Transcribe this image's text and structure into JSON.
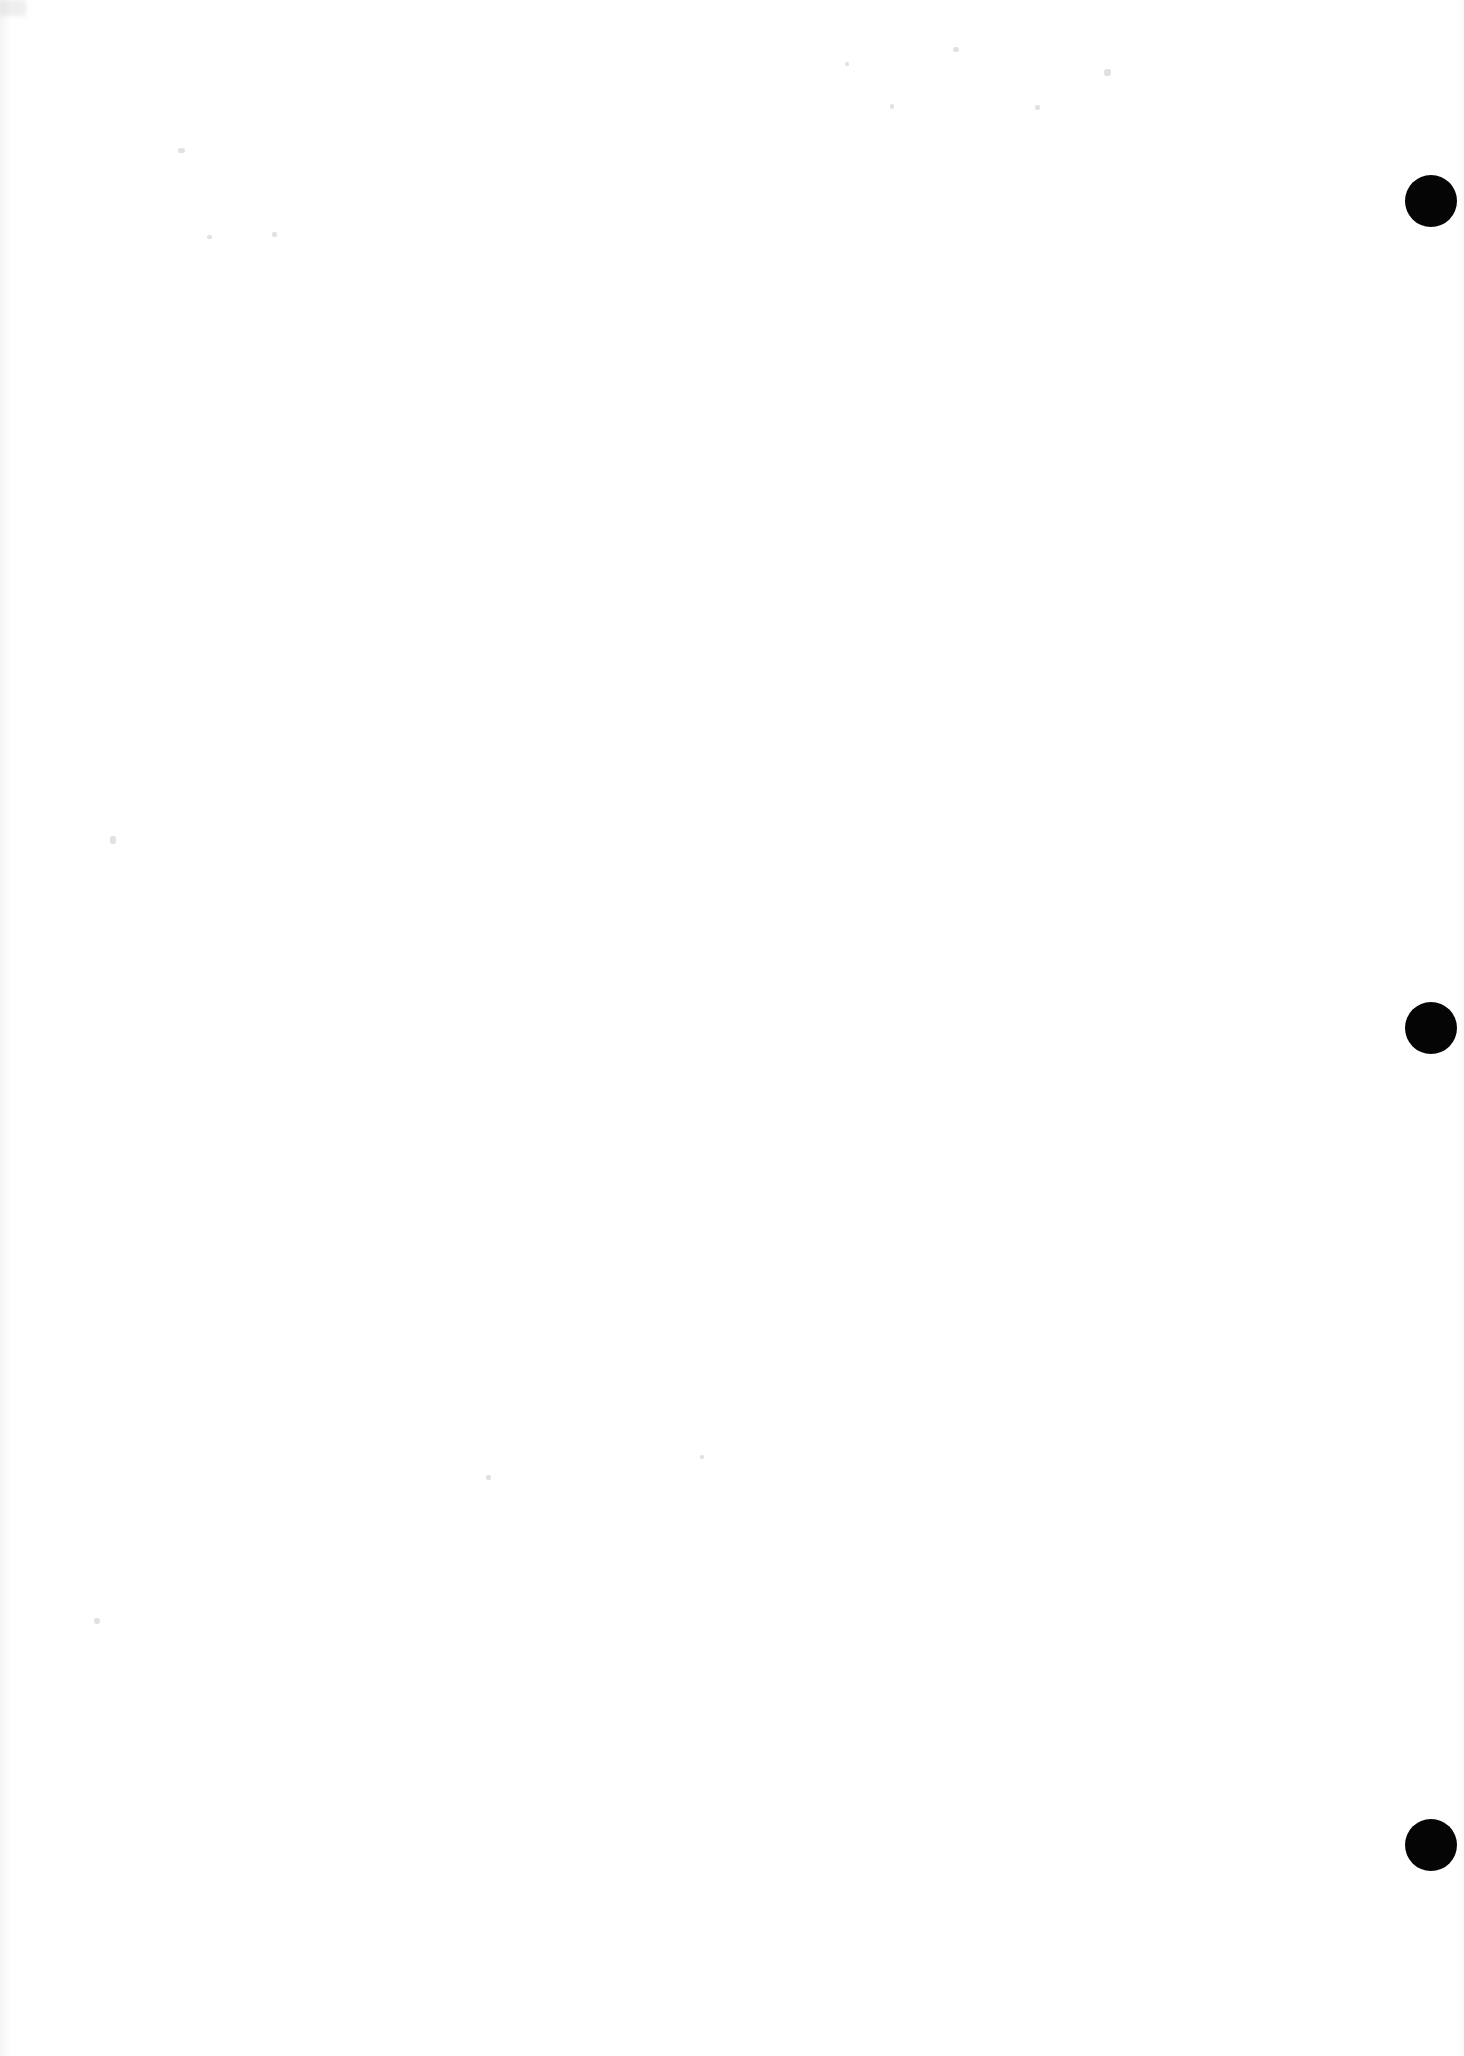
{
  "page": {
    "label": "scanned-blank-page",
    "width": 1464,
    "height": 2056,
    "background_color": "#ffffff",
    "orientation": "portrait",
    "visible_text": "",
    "body_text": ""
  },
  "marks": {
    "ink_color": "#050505",
    "binding_marks": [
      {
        "name": "binding-mark-top",
        "cx": 1431,
        "cy": 201,
        "r": 26
      },
      {
        "name": "binding-mark-middle",
        "cx": 1431,
        "cy": 1028,
        "r": 26
      },
      {
        "name": "binding-mark-bottom",
        "cx": 1431,
        "cy": 1845,
        "r": 26
      }
    ]
  },
  "artifacts": {
    "edge_band_color": "#787c82",
    "speck_color": "#78787f",
    "specks": [
      {
        "x": 178,
        "y": 148,
        "w": 7,
        "h": 5
      },
      {
        "x": 110,
        "y": 836,
        "w": 6,
        "h": 8
      },
      {
        "x": 94,
        "y": 1618,
        "w": 6,
        "h": 6
      },
      {
        "x": 272,
        "y": 232,
        "w": 5,
        "h": 5
      },
      {
        "x": 1104,
        "y": 69,
        "w": 7,
        "h": 7
      },
      {
        "x": 1035,
        "y": 105,
        "w": 5,
        "h": 5
      },
      {
        "x": 890,
        "y": 104,
        "w": 4,
        "h": 5
      },
      {
        "x": 953,
        "y": 47,
        "w": 6,
        "h": 5
      },
      {
        "x": 486,
        "y": 1475,
        "w": 5,
        "h": 5
      },
      {
        "x": 700,
        "y": 1455,
        "w": 4,
        "h": 4
      },
      {
        "x": 845,
        "y": 62,
        "w": 4,
        "h": 4
      },
      {
        "x": 207,
        "y": 235,
        "w": 5,
        "h": 4
      }
    ]
  }
}
